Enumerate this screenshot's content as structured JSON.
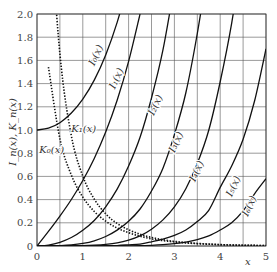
{
  "chart_data": {
    "type": "line",
    "title": "",
    "xlabel": "x",
    "ylabel": "I_n(x), K_n(x)",
    "xlim": [
      0,
      5
    ],
    "ylim": [
      0,
      2.0
    ],
    "grid": true,
    "x_ticks": [
      "0",
      "1",
      "2",
      "3",
      "4",
      "5"
    ],
    "y_ticks": [
      "0",
      "0.2",
      "0.4",
      "0.6",
      "0.8",
      "1.0",
      "1.2",
      "1.4",
      "1.6",
      "1.8",
      "2.0"
    ],
    "x": [
      0,
      0.25,
      0.5,
      0.75,
      1.0,
      1.25,
      1.5,
      1.75,
      2.0,
      2.25,
      2.5,
      2.75,
      3.0,
      3.25,
      3.5,
      3.75,
      4.0,
      4.25,
      4.5,
      4.75,
      5.0
    ],
    "series": [
      {
        "name": "I0(x)",
        "label": "I₀(x)",
        "style": "solid",
        "values": [
          1.0,
          1.016,
          1.063,
          1.146,
          1.266,
          1.43,
          1.647,
          1.928,
          2.28,
          null,
          null,
          null,
          null,
          null,
          null,
          null,
          null,
          null,
          null,
          null,
          null
        ]
      },
      {
        "name": "I1(x)",
        "label": "I₁(x)",
        "style": "solid",
        "values": [
          0,
          0.126,
          0.258,
          0.401,
          0.565,
          0.755,
          0.982,
          1.256,
          1.591,
          2.0,
          null,
          null,
          null,
          null,
          null,
          null,
          null,
          null,
          null,
          null,
          null
        ]
      },
      {
        "name": "I2(x)",
        "label": "I₂(x)",
        "style": "solid",
        "values": [
          0,
          0.008,
          0.032,
          0.073,
          0.136,
          0.22,
          0.338,
          0.49,
          0.689,
          0.937,
          1.276,
          1.69,
          2.245,
          null,
          null,
          null,
          null,
          null,
          null,
          null,
          null
        ]
      },
      {
        "name": "I3(x)",
        "label": "I₃(x)",
        "style": "solid",
        "values": [
          0,
          0.0003,
          0.003,
          0.009,
          0.022,
          0.045,
          0.082,
          0.137,
          0.213,
          0.319,
          0.474,
          0.671,
          0.96,
          1.321,
          1.832,
          2.45,
          null,
          null,
          null,
          null,
          null
        ]
      },
      {
        "name": "I4(x)",
        "label": "I₄(x)",
        "style": "solid",
        "values": [
          0,
          0,
          0.0002,
          0.001,
          0.003,
          0.007,
          0.014,
          0.027,
          0.051,
          0.087,
          0.145,
          0.225,
          0.337,
          0.494,
          0.711,
          0.998,
          1.416,
          1.92,
          2.56,
          null,
          null
        ]
      },
      {
        "name": "I5(x)",
        "label": "I₅(x)",
        "style": "solid",
        "values": [
          0,
          0,
          0,
          0,
          0.0003,
          0.001,
          0.002,
          0.004,
          0.01,
          0.017,
          0.036,
          0.059,
          0.091,
          0.138,
          0.211,
          0.308,
          0.505,
          0.69,
          0.92,
          1.25,
          1.7
        ]
      },
      {
        "name": "I6(x)",
        "label": "I₆(x)",
        "style": "solid",
        "values": [
          0,
          0,
          0,
          0,
          0,
          0,
          0.0002,
          0.0006,
          0.001,
          0.002,
          0.006,
          0.012,
          0.021,
          0.034,
          0.055,
          0.087,
          0.138,
          0.2,
          0.302,
          0.45,
          0.58
        ]
      },
      {
        "name": "K0(x)",
        "label": "K₀(x)",
        "style": "dotted",
        "values": [
          null,
          1.542,
          0.924,
          0.611,
          0.421,
          0.298,
          0.214,
          0.155,
          0.114,
          0.084,
          0.062,
          0.046,
          0.035,
          0.026,
          0.02,
          0.015,
          0.011,
          0.008,
          0.006,
          0.005,
          0.004
        ]
      },
      {
        "name": "K1(x)",
        "label": "K₁(x)",
        "style": "dotted",
        "values": [
          null,
          3.747,
          1.656,
          0.95,
          0.602,
          0.404,
          0.277,
          0.194,
          0.14,
          0.101,
          0.074,
          0.054,
          0.04,
          0.03,
          0.022,
          0.017,
          0.012,
          0.009,
          0.007,
          0.005,
          0.004
        ]
      }
    ],
    "annotations": [
      {
        "text": "I₀(x)",
        "x": 1.25,
        "y": 1.55
      },
      {
        "text": "I₁(x)",
        "x": 1.7,
        "y": 1.35
      },
      {
        "text": "I₂(x)",
        "x": 2.55,
        "y": 1.12
      },
      {
        "text": "I₃(x)",
        "x": 3.0,
        "y": 0.8
      },
      {
        "text": "I₄(x)",
        "x": 3.45,
        "y": 0.55
      },
      {
        "text": "I₅(x)",
        "x": 4.25,
        "y": 0.42
      },
      {
        "text": "I₆(x)",
        "x": 4.6,
        "y": 0.25
      },
      {
        "text": "K₁(x)",
        "x": 0.75,
        "y": 0.98
      },
      {
        "text": "K₀(x)",
        "x": 0.05,
        "y": 0.8
      }
    ]
  }
}
